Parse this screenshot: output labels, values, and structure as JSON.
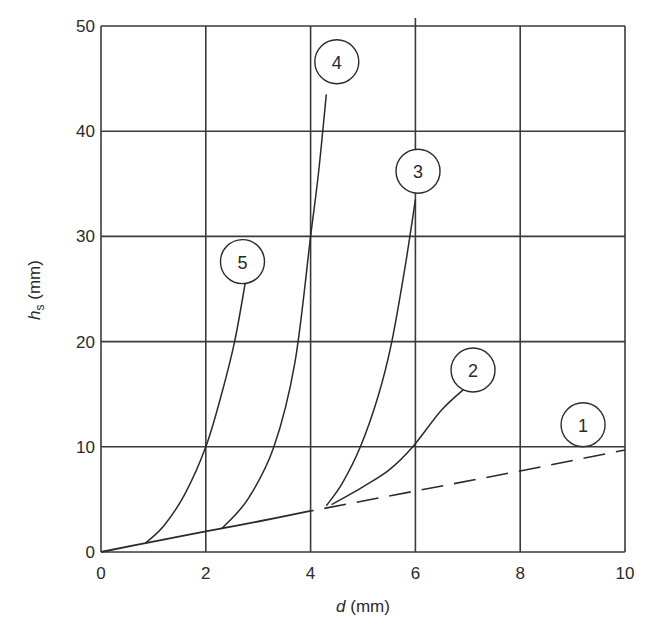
{
  "chart_data": {
    "type": "line",
    "title": "",
    "xlabel": "d (mm)",
    "xlabel_italic": "d",
    "xlabel_unit": " (mm)",
    "ylabel": "h_s (mm)",
    "ylabel_italic": "h",
    "ylabel_sub": "s",
    "ylabel_unit": " (mm)",
    "xlim": [
      0,
      10
    ],
    "ylim": [
      0,
      50
    ],
    "xticks": [
      "0",
      "2",
      "4",
      "6",
      "8",
      "10"
    ],
    "yticks": [
      "0",
      "10",
      "20",
      "30",
      "40",
      "50"
    ],
    "grid": true,
    "legend": "numbered circle labels on curves",
    "series": [
      {
        "name": "1",
        "style": "solid then dashed",
        "x": [
          0,
          0.9,
          2,
          3,
          4,
          6,
          8,
          10
        ],
        "y": [
          0,
          0.9,
          1.95,
          2.9,
          3.9,
          5.8,
          7.7,
          9.7
        ],
        "dashed_from_x": 4.2
      },
      {
        "name": "2",
        "style": "solid",
        "x": [
          4.4,
          5.0,
          5.5,
          5.95,
          6.5,
          7.0
        ],
        "y": [
          4.5,
          6.2,
          7.8,
          10,
          13.5,
          15.8
        ]
      },
      {
        "name": "3",
        "style": "solid",
        "x": [
          4.3,
          4.6,
          4.95,
          5.3,
          5.55,
          5.8,
          6.0
        ],
        "y": [
          4.4,
          6.5,
          10,
          15,
          20,
          27,
          33.5
        ]
      },
      {
        "name": "4",
        "style": "solid",
        "x": [
          2.3,
          2.8,
          3.3,
          3.7,
          4.0,
          4.15,
          4.3
        ],
        "y": [
          2.2,
          5,
          10,
          18,
          30,
          36,
          43.5
        ]
      },
      {
        "name": "5",
        "style": "solid",
        "x": [
          0.85,
          1.2,
          1.6,
          2.0,
          2.3,
          2.55,
          2.75
        ],
        "y": [
          0.85,
          2.5,
          5.5,
          10,
          15,
          20,
          25.5
        ]
      }
    ],
    "markers": [
      {
        "label": "1",
        "x": 9.2,
        "y": 12.1
      },
      {
        "label": "2",
        "x": 7.1,
        "y": 17.3
      },
      {
        "label": "3",
        "x": 6.05,
        "y": 36.2
      },
      {
        "label": "4",
        "x": 4.5,
        "y": 46.6
      },
      {
        "label": "5",
        "x": 2.7,
        "y": 27.6
      }
    ]
  },
  "colors": {
    "line": "#2a2a2a",
    "grid": "#3a3a3a",
    "background": "#ffffff"
  }
}
